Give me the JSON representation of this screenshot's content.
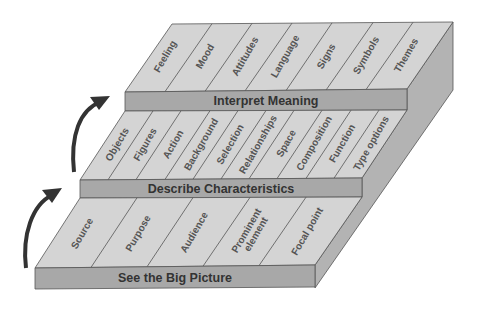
{
  "diagram": {
    "colors": {
      "top": "#d4d4d4",
      "front": "#a8a8a8",
      "side": "#b3b3b3",
      "text": "#333333"
    },
    "tiers": [
      {
        "label": "Interpret Meaning",
        "items": [
          "Feeling",
          "Mood",
          "Attitudes",
          "Language",
          "Signs",
          "Symbols",
          "Themes"
        ]
      },
      {
        "label": "Describe Characteristics",
        "items": [
          "Objects",
          "Figures",
          "Action",
          "Background",
          "Selection",
          "Relationships",
          "Space",
          "Composition",
          "Function",
          "Type options"
        ]
      },
      {
        "label": "See the Big Picture",
        "items": [
          "Source",
          "Purpose",
          "Audience",
          "Prominent element",
          "Focal point"
        ],
        "multiline": {
          "Prominent element": [
            "Prominent",
            "element"
          ]
        }
      }
    ],
    "arrows": [
      {
        "from": "See the Big Picture",
        "to": "Describe Characteristics"
      },
      {
        "from": "Describe Characteristics",
        "to": "Interpret Meaning"
      }
    ]
  }
}
